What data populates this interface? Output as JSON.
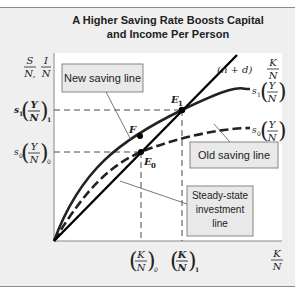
{
  "figure": {
    "title_line1": "A Higher Saving Rate Boosts Capital",
    "title_line2": "and Income Per Person"
  },
  "axes": {
    "y_label_left": {
      "num": "S",
      "den": "N,"
    },
    "y_label_right": {
      "num": "I",
      "den": "N"
    },
    "x_label": {
      "num": "K",
      "den": "N"
    }
  },
  "curves": {
    "investment_line": {
      "prefix": "(n + d)",
      "num": "K",
      "den": "N",
      "style": "solid-straight"
    },
    "new_saving": {
      "coef": "s",
      "coef_sub": "1",
      "num": "Y",
      "den": "N",
      "style": "solid-curve"
    },
    "old_saving": {
      "coef": "s",
      "coef_sub": "0",
      "num": "Y",
      "den": "N",
      "style": "dashed-curve"
    }
  },
  "points": {
    "E1": {
      "letter": "E",
      "sub": "1"
    },
    "E0": {
      "letter": "E",
      "sub": "0"
    },
    "F": {
      "letter": "F"
    }
  },
  "y_ticks": {
    "high": {
      "coef": "s",
      "coef_sub": "1",
      "num": "Y",
      "den": "N",
      "sub": "1"
    },
    "low": {
      "coef": "s",
      "coef_sub": "0",
      "num": "Y",
      "den": "N",
      "sub": "0"
    }
  },
  "x_ticks": {
    "k0": {
      "num": "K",
      "den": "N",
      "sub": "0"
    },
    "k1": {
      "num": "K",
      "den": "N",
      "sub": "1"
    }
  },
  "callouts": {
    "new_saving": "New saving line",
    "old_saving": "Old saving line",
    "steady_line1": "Steady-state",
    "steady_line2": "investment",
    "steady_line3": "line"
  },
  "colors": {
    "panel_bg": "#efefef",
    "plot_bg": "#ffffff",
    "line": "#111111",
    "box_bg": "#e9e9e9",
    "box_border": "#7a7a7a"
  }
}
